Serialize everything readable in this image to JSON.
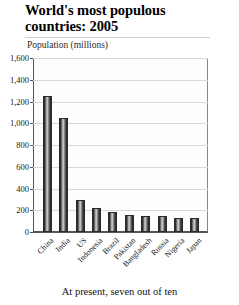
{
  "title": "World's most populous countries: 2005",
  "axis_title": "Population (millions)",
  "caption": "At present, seven out of ten",
  "chart_data": {
    "type": "bar",
    "title": "World's most populous countries: 2005",
    "subtitle": "",
    "xlabel": "",
    "ylabel": "Population (millions)",
    "ylim": [
      0,
      1600
    ],
    "yticks": [
      "0",
      "200",
      "400",
      "600",
      "800",
      "1,000",
      "1,200",
      "1,400",
      "1,600"
    ],
    "ytick_values": [
      0,
      200,
      400,
      600,
      800,
      1000,
      1200,
      1400,
      1600
    ],
    "grid": true,
    "legend": "none",
    "categories": [
      "China",
      "India",
      "US",
      "Indonesia",
      "Brazil",
      "Pakistan",
      "Bangladesh",
      "Russia",
      "Nigeria",
      "Japan"
    ],
    "values": [
      1250,
      1050,
      295,
      225,
      185,
      160,
      145,
      143,
      130,
      128
    ],
    "bar_color": "#4a4a4a",
    "grid_color": "#d8d8d8",
    "axis_color": "#555555"
  }
}
